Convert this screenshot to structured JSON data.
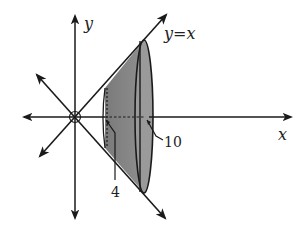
{
  "diagram": {
    "type": "solid-of-revolution",
    "labels": {
      "y_axis": "y",
      "x_axis": "x",
      "line": "y=x",
      "x_start": "4",
      "x_end": "10"
    },
    "colors": {
      "stroke": "#1a1a1a",
      "solid_fill": "#8a8a8a",
      "solid_fill_dark": "#6e6e6e",
      "background": "#ffffff"
    }
  }
}
